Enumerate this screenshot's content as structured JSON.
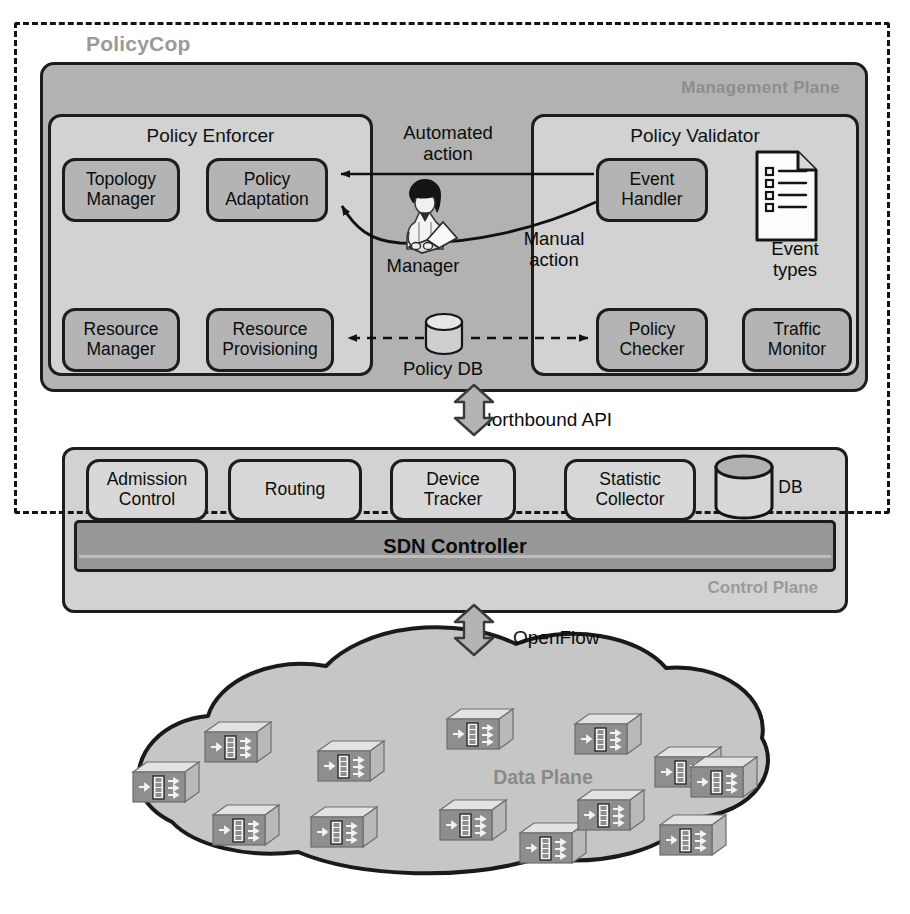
{
  "diagram": {
    "title": "PolicyCop",
    "planes": {
      "management": "Management Plane",
      "control": "Control Plane",
      "data": "Data Plane"
    },
    "interfaces": {
      "northbound": "Northbound API",
      "southbound": "OpenFlow"
    }
  },
  "management_plane": {
    "policy_enforcer": {
      "title": "Policy Enforcer",
      "modules": [
        {
          "label": "Topology\nManager",
          "line1": "Topology",
          "line2": "Manager"
        },
        {
          "label": "Policy\nAdaptation",
          "line1": "Policy",
          "line2": "Adaptation"
        },
        {
          "label": "Resource\nManager",
          "line1": "Resource",
          "line2": "Manager"
        },
        {
          "label": "Resource\nProvisioning",
          "line1": "Resource",
          "line2": "Provisioning"
        }
      ]
    },
    "policy_validator": {
      "title": "Policy Validator",
      "modules": [
        {
          "label": "Event\nHandler",
          "line1": "Event",
          "line2": "Handler"
        },
        {
          "label": "Policy\nChecker",
          "line1": "Policy",
          "line2": "Checker"
        },
        {
          "label": "Traffic\nMonitor",
          "line1": "Traffic",
          "line2": "Monitor"
        }
      ],
      "artifact": {
        "label": "Event\ntypes",
        "line1": "Event",
        "line2": "types",
        "icon": "document-checklist-icon"
      }
    },
    "center": {
      "automated_action": "Automated\naction",
      "automated_action_line1": "Automated",
      "automated_action_line2": "action",
      "manual_action": "Manual\naction",
      "manual_action_line1": "Manual",
      "manual_action_line2": "action",
      "manager": "Manager",
      "policy_db": "Policy DB"
    }
  },
  "control_plane": {
    "controller": "SDN Controller",
    "apps": [
      {
        "label": "Admission\nControl",
        "line1": "Admission",
        "line2": "Control"
      },
      {
        "label": "Routing",
        "line1": "Routing",
        "line2": ""
      },
      {
        "label": "Device\nTracker",
        "line1": "Device",
        "line2": "Tracker"
      },
      {
        "label": "Statistic\nCollector",
        "line1": "Statistic",
        "line2": "Collector"
      }
    ],
    "rule_db": "Rule DB"
  },
  "data_plane": {
    "label": "Data Plane",
    "switch_count": 13,
    "switch_icon": "network-switch-icon"
  },
  "colors": {
    "management_plane_bg": "#b2b2b2",
    "panel_bg": "#d2d2d2",
    "chip_bg": "#b4b4b4",
    "control_plane_bg": "#d2d2d2",
    "sdn_bar_bg": "#989898",
    "cloud_bg": "#c6c6c6",
    "outline": "#1d1d1d",
    "plane_label_gray": "#8d8d8d",
    "arrow_fill": "#b4b4b4"
  }
}
